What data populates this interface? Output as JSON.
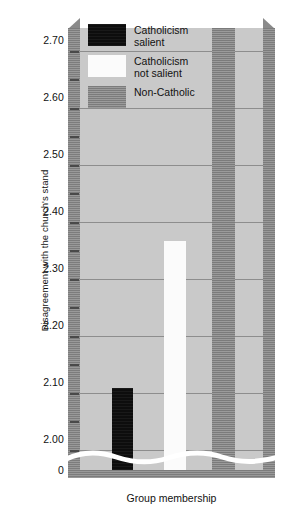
{
  "chart_data": {
    "type": "bar",
    "title": "",
    "xlabel": "Group membership",
    "ylabel": "Disagreement with the church's stand",
    "categories": [
      "Catholicism salient",
      "Catholicism not salient",
      "Non-Catholic"
    ],
    "values": [
      2.1,
      2.36,
      2.74
    ],
    "series": [
      {
        "name": "Disagreement with the church's stand",
        "values": [
          2.1,
          2.36,
          2.74
        ]
      }
    ],
    "ylim": [
      1.955,
      2.735
    ],
    "y_axis_break": true,
    "y_break_label": "0",
    "yticks": [
      2.0,
      2.1,
      2.2,
      2.3,
      2.4,
      2.5,
      2.6,
      2.7
    ],
    "ytick_labels": [
      "2.00",
      "2.10",
      "2.20",
      "2.30",
      "2.40",
      "2.50",
      "2.60",
      "2.70"
    ],
    "minor_tick_step": 0.05,
    "grid": true,
    "grid_axis": "y",
    "legend_position": "upper-left-inside",
    "bar_colors": [
      "#0d0d0d",
      "#fbfbfb",
      "#8a8a8a"
    ],
    "plot_background": "#c9c9c9",
    "figure_background": "#ffffff"
  },
  "axes": {
    "y_title": "Disagreement with the church's stand",
    "x_title": "Group membership",
    "zero_label": "0",
    "ticks": [
      {
        "label": "2.70",
        "value": 2.7
      },
      {
        "label": "2.60",
        "value": 2.6
      },
      {
        "label": "2.50",
        "value": 2.5
      },
      {
        "label": "2.40",
        "value": 2.4
      },
      {
        "label": "2.30",
        "value": 2.3
      },
      {
        "label": "2.20",
        "value": 2.2
      },
      {
        "label": "2.10",
        "value": 2.1
      },
      {
        "label": "2.00",
        "value": 2.0
      }
    ]
  },
  "legend": {
    "items": [
      {
        "label": "Catholicism\nsalient",
        "color": "#0d0d0d",
        "swatch": "black-swatch"
      },
      {
        "label": "Catholicism\nnot salient",
        "color": "#fbfbfb",
        "swatch": "white-swatch"
      },
      {
        "label": "Non-Catholic",
        "color": "#8a8a8a",
        "swatch": "gray-swatch"
      }
    ]
  },
  "bars": [
    {
      "name": "catholicism-salient",
      "value": 2.1,
      "label": "2.10"
    },
    {
      "name": "catholicism-not-salient",
      "value": 2.36,
      "label": "2.36"
    },
    {
      "name": "non-catholic",
      "value": 2.74,
      "label": "2.74"
    }
  ]
}
